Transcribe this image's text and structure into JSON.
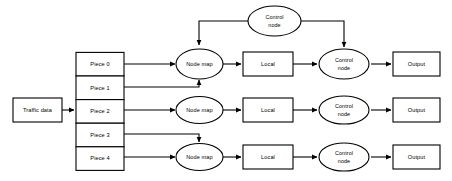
{
  "diagram": {
    "colors": {
      "stroke": "#000000",
      "fill": "#ffffff",
      "background": "#ffffff"
    },
    "source": {
      "label": "Traffic data"
    },
    "pieces": [
      {
        "label": "Piece 0"
      },
      {
        "label": "Piece 1"
      },
      {
        "label": "Piece 2"
      },
      {
        "label": "Piece 3"
      },
      {
        "label": "Piece 4"
      }
    ],
    "top_control": {
      "line1": "Control",
      "line2": "node"
    },
    "rows": [
      {
        "node_map": {
          "label": "Node map"
        },
        "local": {
          "label": "Local"
        },
        "control": {
          "line1": "Control",
          "line2": "node"
        },
        "output": {
          "label": "Output"
        }
      },
      {
        "node_map": {
          "label": "Node map"
        },
        "local": {
          "label": "Local"
        },
        "control": {
          "line1": "Control",
          "line2": "node"
        },
        "output": {
          "label": "Output"
        }
      },
      {
        "node_map": {
          "label": "Node map"
        },
        "local": {
          "label": "Local"
        },
        "control": {
          "line1": "Control",
          "line2": "node"
        },
        "output": {
          "label": "Output"
        }
      }
    ]
  }
}
